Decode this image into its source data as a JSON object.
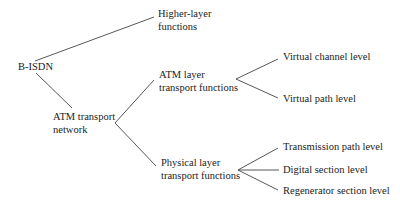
{
  "diagram": {
    "root": "B-ISDN",
    "nodes": {
      "bisdn": "B-ISDN",
      "higher_line1": "Higher-layer",
      "higher_line2": "functions",
      "atm_net_line1": "ATM transport",
      "atm_net_line2": "network",
      "atm_layer_line1": "ATM layer",
      "atm_layer_line2": "transport functions",
      "phys_layer_line1": "Physical layer",
      "phys_layer_line2": "transport functions",
      "virtual_channel": "Virtual channel level",
      "virtual_path": "Virtual path level",
      "transmission_path": "Transmission path level",
      "digital_section": "Digital section level",
      "regenerator_section": "Regenerator section level"
    },
    "edges": [
      [
        "B-ISDN",
        "Higher-layer functions"
      ],
      [
        "B-ISDN",
        "ATM transport network"
      ],
      [
        "ATM transport network",
        "ATM layer transport functions"
      ],
      [
        "ATM transport network",
        "Physical layer transport functions"
      ],
      [
        "ATM layer transport functions",
        "Virtual channel level"
      ],
      [
        "ATM layer transport functions",
        "Virtual path level"
      ],
      [
        "Physical layer transport functions",
        "Transmission path level"
      ],
      [
        "Physical layer transport functions",
        "Digital section level"
      ],
      [
        "Physical layer transport functions",
        "Regenerator section level"
      ]
    ],
    "line_color": "#444444",
    "text_color": "#222222"
  }
}
